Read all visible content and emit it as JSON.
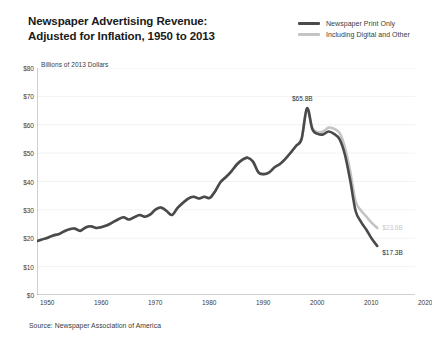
{
  "header": {
    "title": "Newspaper Advertising Revenue:\nAdjusted for Inflation, 1950 to 2013"
  },
  "legend": {
    "position": "top-right",
    "items": [
      {
        "label": "Newspaper Print Only",
        "color": "#4a4a4a"
      },
      {
        "label": "Including Digital and Other",
        "color": "#c4c4c4"
      }
    ]
  },
  "footer": {
    "source": "Source: Newspaper Association of America"
  },
  "annotations": [
    {
      "name": "peak-label",
      "text": "$65.8B",
      "x_year": 2000,
      "y_value": 65.8,
      "style": "dark"
    },
    {
      "name": "digital-end-label",
      "text": "$23.6B",
      "x_year": 2013,
      "y_value": 23.6,
      "style": "light"
    },
    {
      "name": "print-end-label",
      "text": "$17.3B",
      "x_year": 2013,
      "y_value": 17.3,
      "style": "dark"
    }
  ],
  "chart_data": {
    "type": "line",
    "title": "Newspaper Advertising Revenue: Adjusted for Inflation, 1950 to 2013",
    "xlabel": "",
    "ylabel": "Billions of 2013 Dollars",
    "xlim": [
      1950,
      2020
    ],
    "ylim": [
      0,
      80
    ],
    "xticks": [
      1950,
      1960,
      1970,
      1980,
      1990,
      2000,
      2010,
      2020
    ],
    "xtick_labels": [
      "1950",
      "1960",
      "1970",
      "1980",
      "1990",
      "2000",
      "2010",
      "2020"
    ],
    "yticks": [
      0,
      10,
      20,
      30,
      40,
      50,
      60,
      70,
      80
    ],
    "ytick_labels": [
      "$0",
      "$10",
      "$20",
      "$30",
      "$40",
      "$50",
      "$60",
      "$70",
      "$80"
    ],
    "grid": "horizontal-light",
    "legend_position": "top-right",
    "x": [
      1950,
      1951,
      1952,
      1953,
      1954,
      1955,
      1956,
      1957,
      1958,
      1959,
      1960,
      1961,
      1962,
      1963,
      1964,
      1965,
      1966,
      1967,
      1968,
      1969,
      1970,
      1971,
      1972,
      1973,
      1974,
      1975,
      1976,
      1977,
      1978,
      1979,
      1980,
      1981,
      1982,
      1983,
      1984,
      1985,
      1986,
      1987,
      1988,
      1989,
      1990,
      1991,
      1992,
      1993,
      1994,
      1995,
      1996,
      1997,
      1998,
      1999,
      2000,
      2001,
      2002,
      2003,
      2004,
      2005,
      2006,
      2007,
      2008,
      2009,
      2010,
      2011,
      2012,
      2013
    ],
    "series": [
      {
        "name": "Newspaper Print Only",
        "color": "#4a4a4a",
        "values": [
          19.0,
          19.6,
          20.2,
          21.0,
          21.4,
          22.4,
          23.2,
          23.4,
          22.6,
          23.8,
          24.2,
          23.6,
          24.0,
          24.6,
          25.6,
          26.6,
          27.4,
          26.6,
          27.4,
          28.2,
          27.6,
          28.4,
          30.2,
          30.8,
          29.6,
          28.2,
          30.6,
          32.4,
          34.0,
          34.6,
          34.0,
          34.6,
          34.2,
          36.6,
          39.8,
          41.6,
          43.6,
          46.0,
          47.6,
          48.4,
          47.0,
          43.2,
          42.6,
          43.2,
          45.0,
          46.2,
          48.0,
          50.2,
          52.6,
          55.0,
          65.8,
          58.4,
          56.8,
          56.6,
          57.6,
          56.8,
          55.0,
          49.6,
          40.4,
          29.6,
          25.8,
          23.0,
          19.8,
          17.3
        ]
      },
      {
        "name": "Including Digital and Other",
        "color": "#c4c4c4",
        "values": [
          19.0,
          19.6,
          20.2,
          21.0,
          21.4,
          22.4,
          23.2,
          23.4,
          22.6,
          23.8,
          24.2,
          23.6,
          24.0,
          24.6,
          25.6,
          26.6,
          27.4,
          26.6,
          27.4,
          28.2,
          27.6,
          28.4,
          30.2,
          30.8,
          29.6,
          28.2,
          30.6,
          32.4,
          34.0,
          34.6,
          34.0,
          34.6,
          34.2,
          36.6,
          39.8,
          41.6,
          43.6,
          46.0,
          47.6,
          48.4,
          47.0,
          43.2,
          42.6,
          43.2,
          45.0,
          46.2,
          48.0,
          50.2,
          52.6,
          55.0,
          65.8,
          58.8,
          57.4,
          57.6,
          59.0,
          58.6,
          57.2,
          52.2,
          43.6,
          33.0,
          29.8,
          27.6,
          25.4,
          23.6
        ]
      }
    ]
  }
}
